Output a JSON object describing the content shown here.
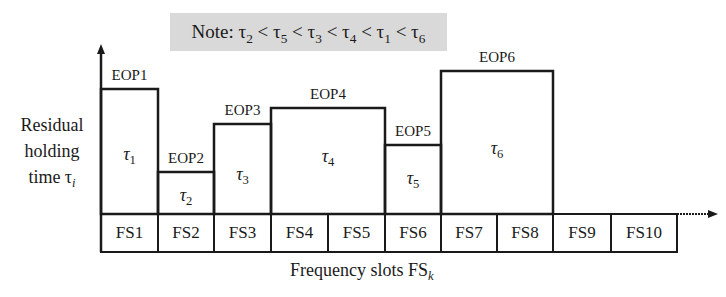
{
  "note": {
    "text_html": "Note: τ<sub>2</sub> &lt; τ<sub>5</sub> &lt; τ<sub>3</sub> &lt; τ<sub>4</sub> &lt; τ<sub>1</sub> &lt; τ<sub>6</sub>",
    "text": "Note: τ2 < τ5 < τ3 < τ4 < τ1 < τ6"
  },
  "y_axis": {
    "label_lines": [
      "Residual",
      "holding",
      "time τ"
    ],
    "label_sub": "i"
  },
  "x_axis": {
    "label": "Frequency slots FS",
    "label_sub": "k"
  },
  "slots": [
    "FS1",
    "FS2",
    "FS3",
    "FS4",
    "FS5",
    "FS6",
    "FS7",
    "FS8",
    "FS9",
    "FS10"
  ],
  "eops": [
    {
      "label": "EOP1",
      "tau": "τ",
      "sub": "1",
      "slots": [
        "FS1"
      ]
    },
    {
      "label": "EOP2",
      "tau": "τ",
      "sub": "2",
      "slots": [
        "FS2"
      ]
    },
    {
      "label": "EOP3",
      "tau": "τ",
      "sub": "3",
      "slots": [
        "FS3"
      ]
    },
    {
      "label": "EOP4",
      "tau": "τ",
      "sub": "4",
      "slots": [
        "FS4",
        "FS5"
      ]
    },
    {
      "label": "EOP5",
      "tau": "τ",
      "sub": "5",
      "slots": [
        "FS6"
      ]
    },
    {
      "label": "EOP6",
      "tau": "τ",
      "sub": "6",
      "slots": [
        "FS7",
        "FS8"
      ]
    }
  ]
}
